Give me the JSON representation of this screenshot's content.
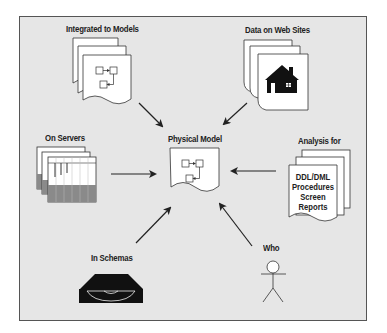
{
  "diagram": {
    "center": {
      "label": "Physical Model",
      "icon": "flowchart-document-icon"
    },
    "sources": [
      {
        "id": "integrated",
        "label": "Integrated to Models",
        "icon": "stacked-flowchart-documents-icon"
      },
      {
        "id": "web",
        "label": "Data on Web Sites",
        "icon": "stacked-house-documents-icon"
      },
      {
        "id": "servers",
        "label": "On Servers",
        "icon": "stacked-spreadsheet-icon"
      },
      {
        "id": "analysis",
        "label": "Analysis for",
        "icon": "stacked-documents-icon",
        "doc_lines": [
          "DDL/DML",
          "Procedures",
          "Screen",
          "Reports"
        ]
      },
      {
        "id": "schemas",
        "label": "In Schemas",
        "icon": "disk-drive-icon"
      },
      {
        "id": "who",
        "label": "Who",
        "icon": "stick-figure-icon"
      }
    ],
    "colors": {
      "panel_bg": "#e6e6e6",
      "border": "#555555",
      "ink": "#222222",
      "sheet": "#ffffff",
      "shade": "#8a8a8a"
    }
  }
}
